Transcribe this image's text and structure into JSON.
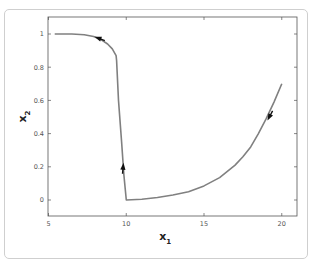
{
  "chart_data": {
    "type": "line",
    "title": "",
    "xlabel": "x",
    "xlabel_subscript": "1",
    "ylabel": "x",
    "ylabel_subscript": "2",
    "xlim": [
      5,
      21
    ],
    "ylim": [
      -0.1,
      1.1
    ],
    "xticks": [
      5,
      10,
      15,
      20
    ],
    "xtick_labels": [
      "5",
      "10",
      "15",
      "20"
    ],
    "yticks": [
      0,
      0.2,
      0.4,
      0.6,
      0.8,
      1
    ],
    "ytick_labels": [
      "0",
      "0.2",
      "0.4",
      "0.6",
      "0.8",
      "1"
    ],
    "grid": false,
    "legend": null,
    "series": [
      {
        "name": "trajectory",
        "color": "#808080",
        "x": [
          5.4,
          6.5,
          7.3,
          7.9,
          8.4,
          8.8,
          9.1,
          9.35,
          9.38,
          9.5,
          9.7,
          9.85,
          10.0,
          11.0,
          12.0,
          13.0,
          14.0,
          15.0,
          16.0,
          17.0,
          17.5,
          18.0,
          18.5,
          19.0,
          19.5,
          20.0
        ],
        "y": [
          1.0,
          1.0,
          0.995,
          0.985,
          0.965,
          0.94,
          0.91,
          0.87,
          0.84,
          0.6,
          0.35,
          0.15,
          0.0,
          0.005,
          0.015,
          0.03,
          0.05,
          0.085,
          0.135,
          0.21,
          0.26,
          0.32,
          0.4,
          0.49,
          0.59,
          0.7
        ]
      }
    ],
    "annotations": [
      {
        "type": "arrow",
        "x": 8.2,
        "y": 0.975,
        "direction": "left-up"
      },
      {
        "type": "arrow",
        "x": 9.8,
        "y": 0.2,
        "direction": "up"
      },
      {
        "type": "arrow",
        "x": 19.2,
        "y": 0.5,
        "direction": "down-left"
      }
    ]
  },
  "layout": {
    "plot_left": 48,
    "plot_top": 17,
    "plot_right": 297,
    "plot_bottom": 216,
    "x0_px": 48.5,
    "x_px_per_unit": 15.55,
    "y0_px": 200,
    "y_px_per_unit": 166
  }
}
